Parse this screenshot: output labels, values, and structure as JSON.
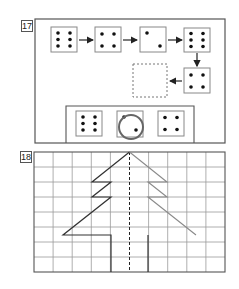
{
  "puzzles": [
    {
      "number": "17",
      "sequence": [
        {
          "pips": 6
        },
        {
          "pips": 4
        },
        {
          "pips": 2
        },
        {
          "pips": 6
        },
        {
          "pips": 4
        },
        {
          "pips": null,
          "state": "blank-dashed"
        }
      ],
      "options": [
        {
          "pips": 6,
          "selected": false
        },
        {
          "pips": 2,
          "selected": true
        },
        {
          "pips": 4,
          "selected": false
        }
      ],
      "answer_marker": "circle"
    },
    {
      "number": "18",
      "grid": {
        "columns": 10,
        "rows": 8
      },
      "figure": "tree-symmetry",
      "axis": "dashed-vertical-center",
      "left_half": "drawn-dark",
      "right_half": "drawn-gray"
    }
  ],
  "colors": {
    "frame": "#555555",
    "die_border": "#888888",
    "pip": "#111111",
    "grid_line": "#9a9a9a",
    "tree_left": "#333333",
    "tree_right": "#8a8a8a",
    "circle": "#666666"
  }
}
